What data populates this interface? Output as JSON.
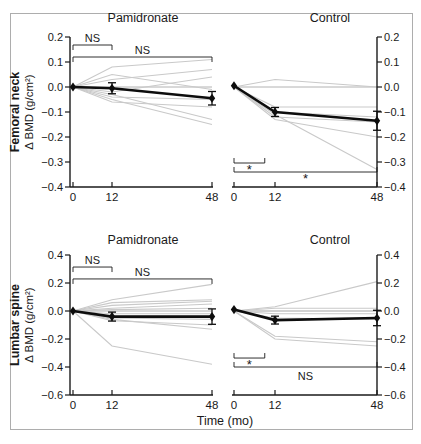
{
  "figure": {
    "column_titles": [
      "Pamidronate",
      "Control"
    ],
    "xlabel": "Time (mo)",
    "x_ticks": [
      "0",
      "12",
      "48"
    ]
  },
  "colors": {
    "mean_line": "#0d0d0d",
    "individual_line": "#c9c9c9",
    "axis": "#1a1a1a",
    "zero_line": "#9a9a9a",
    "border": "#adadad"
  },
  "chart_data": {
    "type": "line",
    "x": [
      0,
      12,
      48
    ],
    "x_label": "Time (mo)",
    "x_ticks": [
      0,
      12,
      48
    ],
    "column_titles": [
      "Pamidronate",
      "Control"
    ],
    "legend": "Thick line = group mean ± SE with diamond markers; thin gray lines = individual patients; NS = not significant; * = significant",
    "rows": [
      {
        "row_label": "Femoral neck",
        "ylabel": "Δ BMD (g/cm²)",
        "ylim": [
          -0.4,
          0.2
        ],
        "yticks": [
          0.2,
          0.1,
          0.0,
          -0.1,
          -0.2,
          -0.3,
          -0.4
        ],
        "panels": [
          {
            "title": "Pamidronate",
            "mean": [
              0.0,
              -0.005,
              -0.045
            ],
            "sem": [
              0.0,
              0.022,
              0.027
            ],
            "individual": [
              [
                0,
                0.08,
                0.11
              ],
              [
                0,
                0.03,
                0.07
              ],
              [
                0,
                -0.02,
                0.04
              ],
              [
                0,
                0.05,
                -0.01
              ],
              [
                0,
                -0.04,
                -0.05
              ],
              [
                0,
                -0.06,
                -0.08
              ],
              [
                0,
                -0.03,
                -0.13
              ],
              [
                0,
                -0.05,
                -0.15
              ]
            ],
            "significance": [
              {
                "x1": 0,
                "x2": 12,
                "y": 0.168,
                "label": "NS",
                "label_side": "above",
                "tick_dir": "down"
              },
              {
                "x1": 0,
                "x2": 48,
                "y": 0.12,
                "label": "NS",
                "label_side": "above",
                "tick_dir": "down"
              }
            ]
          },
          {
            "title": "Control",
            "mean": [
              0.005,
              -0.1,
              -0.135
            ],
            "sem": [
              0.0,
              0.018,
              0.038
            ],
            "individual": [
              [
                0,
                0.03,
                0.0
              ],
              [
                0,
                -0.08,
                -0.08
              ],
              [
                0,
                -0.1,
                -0.12
              ],
              [
                0,
                -0.12,
                -0.14
              ],
              [
                0,
                -0.13,
                -0.2
              ],
              [
                0,
                -0.11,
                -0.33
              ]
            ],
            "significance": [
              {
                "x1": 0,
                "x2": 9,
                "y": -0.304,
                "label": "*",
                "label_side": "below",
                "tick_dir": "up"
              },
              {
                "x1": 0,
                "x2": 48,
                "y": -0.34,
                "label": "*",
                "label_side": "below",
                "tick_dir": "up"
              }
            ]
          }
        ]
      },
      {
        "row_label": "Lumbar spine",
        "ylabel": "Δ BMD (g/cm²)",
        "ylim": [
          -0.6,
          0.4
        ],
        "yticks": [
          0.4,
          0.2,
          0.0,
          -0.2,
          -0.4,
          -0.6
        ],
        "panels": [
          {
            "title": "Pamidronate",
            "mean": [
              0.0,
              -0.04,
              -0.04
            ],
            "sem": [
              0.0,
              0.032,
              0.055
            ],
            "individual": [
              [
                0,
                0.08,
                0.19
              ],
              [
                0,
                0.06,
                0.08
              ],
              [
                0,
                0.04,
                0.07
              ],
              [
                0,
                0.02,
                0.05
              ],
              [
                0,
                0.01,
                0.02
              ],
              [
                0,
                -0.02,
                -0.02
              ],
              [
                0,
                -0.05,
                -0.06
              ],
              [
                0,
                -0.07,
                -0.1
              ],
              [
                0,
                -0.06,
                -0.13
              ],
              [
                0,
                -0.25,
                -0.38
              ]
            ],
            "significance": [
              {
                "x1": 0,
                "x2": 12,
                "y": 0.314,
                "label": "NS",
                "label_side": "above",
                "tick_dir": "down"
              },
              {
                "x1": 0,
                "x2": 48,
                "y": 0.229,
                "label": "NS",
                "label_side": "above",
                "tick_dir": "down"
              }
            ]
          },
          {
            "title": "Control",
            "mean": [
              0.01,
              -0.065,
              -0.05
            ],
            "sem": [
              0.0,
              0.028,
              0.055
            ],
            "individual": [
              [
                0,
                0.03,
                0.21
              ],
              [
                0,
                0.02,
                0.02
              ],
              [
                0,
                0.0,
                0.0
              ],
              [
                0,
                -0.02,
                -0.02
              ],
              [
                0,
                -0.05,
                -0.06
              ],
              [
                0,
                -0.18,
                -0.22
              ],
              [
                0,
                -0.2,
                -0.25
              ]
            ],
            "significance": [
              {
                "x1": 0,
                "x2": 9,
                "y": -0.336,
                "label": "*",
                "label_side": "below",
                "tick_dir": "up"
              },
              {
                "x1": 0,
                "x2": 48,
                "y": -0.4,
                "label": "NS",
                "label_side": "below",
                "tick_dir": "up"
              }
            ]
          }
        ]
      }
    ]
  }
}
